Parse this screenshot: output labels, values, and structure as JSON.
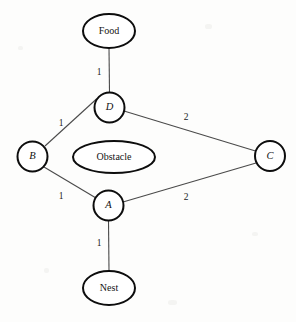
{
  "diagram": {
    "title": "",
    "background_color": "#fdfdfc",
    "node_stroke_color": "#0d0d0d",
    "edge_stroke_color": "#4a4a4a",
    "label_color": "#131313",
    "nodes": [
      {
        "id": "food",
        "label": "Food",
        "shape": "ellipse",
        "style": "upright",
        "cx": 109,
        "cy": 31,
        "rx": 26,
        "ry": 17
      },
      {
        "id": "d",
        "label": "D",
        "shape": "circle",
        "style": "italic",
        "cx": 109.5,
        "cy": 107.5,
        "rx": 15,
        "ry": 15
      },
      {
        "id": "b",
        "label": "B",
        "shape": "circle",
        "style": "italic",
        "cx": 32.5,
        "cy": 156.5,
        "rx": 15,
        "ry": 15
      },
      {
        "id": "c",
        "label": "C",
        "shape": "circle",
        "style": "italic",
        "cx": 270,
        "cy": 156,
        "rx": 15,
        "ry": 15
      },
      {
        "id": "obstacle",
        "label": "Obstacle",
        "shape": "ellipse",
        "style": "upright",
        "cx": 114,
        "cy": 157,
        "rx": 41,
        "ry": 16
      },
      {
        "id": "a",
        "label": "A",
        "shape": "circle",
        "style": "italic",
        "cx": 108.5,
        "cy": 205.5,
        "rx": 15,
        "ry": 15
      },
      {
        "id": "nest",
        "label": "Nest",
        "shape": "ellipse",
        "style": "upright",
        "cx": 109,
        "cy": 288,
        "rx": 26,
        "ry": 17
      }
    ],
    "edges": [
      {
        "id": "food-d",
        "source": "food",
        "target": "d",
        "weight": "1",
        "x1": 109,
        "y1": 48,
        "x2": 109.5,
        "y2": 92.5,
        "lx": 99,
        "ly": 73
      },
      {
        "id": "d-b",
        "source": "d",
        "target": "b",
        "weight": "1",
        "x1": 96.5,
        "y1": 99,
        "x2": 45,
        "y2": 146,
        "lx": 61,
        "ly": 124
      },
      {
        "id": "d-c",
        "source": "d",
        "target": "c",
        "weight": "2",
        "x1": 124,
        "y1": 111,
        "x2": 255.5,
        "y2": 151,
        "lx": 186,
        "ly": 118
      },
      {
        "id": "b-a",
        "source": "b",
        "target": "a",
        "weight": "1",
        "x1": 44,
        "y1": 167,
        "x2": 96,
        "y2": 198,
        "lx": 61,
        "ly": 197
      },
      {
        "id": "a-c",
        "source": "a",
        "target": "c",
        "weight": "2",
        "x1": 123,
        "y1": 202,
        "x2": 256,
        "y2": 163,
        "lx": 186,
        "ly": 198
      },
      {
        "id": "a-nest",
        "source": "a",
        "target": "nest",
        "weight": "1",
        "x1": 108.5,
        "y1": 220.5,
        "x2": 109,
        "y2": 271,
        "lx": 99,
        "ly": 244
      }
    ]
  }
}
